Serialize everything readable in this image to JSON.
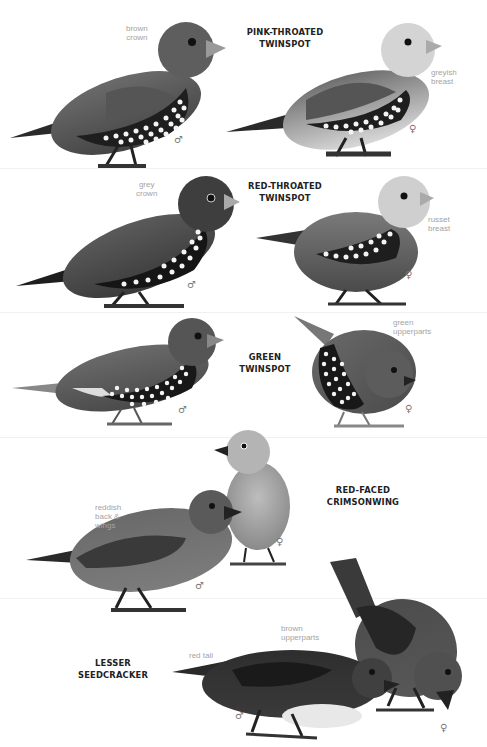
{
  "plate": {
    "background": "#ffffff",
    "species": [
      {
        "name_line1": "PINK-THROATED",
        "name_line2": "TWINSPOT",
        "birds": [
          {
            "sex": "♂",
            "sex_label": "male",
            "notes": [
              "brown",
              "crown"
            ]
          },
          {
            "sex": "♀",
            "sex_label": "female",
            "notes": [
              "greyish",
              "breast"
            ]
          }
        ]
      },
      {
        "name_line1": "RED-THROATED",
        "name_line2": "TWINSPOT",
        "birds": [
          {
            "sex": "♂",
            "sex_label": "male",
            "notes": [
              "grey",
              "crown"
            ]
          },
          {
            "sex": "♀",
            "sex_label": "female",
            "notes": [
              "russet",
              "breast"
            ]
          }
        ]
      },
      {
        "name_line1": "GREEN",
        "name_line2": "TWINSPOT",
        "birds": [
          {
            "sex": "♂",
            "sex_label": "male",
            "notes": []
          },
          {
            "sex": "♀",
            "sex_label": "female",
            "notes": [
              "green",
              "upperparts"
            ]
          }
        ]
      },
      {
        "name_line1": "RED-FACED",
        "name_line2": "CRIMSONWING",
        "birds": [
          {
            "sex": "♂",
            "sex_label": "male",
            "notes": [
              "reddish",
              "back &",
              "wings"
            ]
          },
          {
            "sex": "♀",
            "sex_label": "female",
            "notes": []
          }
        ]
      },
      {
        "name_line1": "LESSER",
        "name_line2": "SEEDCRACKER",
        "birds": [
          {
            "sex": "♂",
            "sex_label": "male",
            "notes": [
              "red tail"
            ],
            "notes2": [
              "brown",
              "upperparts"
            ]
          },
          {
            "sex": "♀",
            "sex_label": "female",
            "notes": []
          }
        ]
      }
    ]
  }
}
